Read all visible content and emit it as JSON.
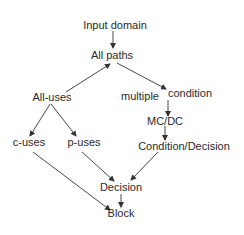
{
  "diagram": {
    "type": "hierarchy",
    "nodes": {
      "input_domain": "Input domain",
      "all_paths": "All paths",
      "all_uses": "All-uses",
      "multiple": "multiple",
      "condition": "condition",
      "mcdc": "MC/DC",
      "c_uses": "c-uses",
      "p_uses": "p-uses",
      "condition_decision": "Condition/Decision",
      "decision": "Decision",
      "block": "Block"
    },
    "edges": [
      {
        "from": "Input domain",
        "to": "All paths"
      },
      {
        "from": "All-uses",
        "to": "All paths"
      },
      {
        "from": "All paths",
        "to": "multiple condition"
      },
      {
        "from": "multiple condition",
        "to": "MC/DC"
      },
      {
        "from": "MC/DC",
        "to": "Condition/Decision"
      },
      {
        "from": "All-uses",
        "to": "c-uses"
      },
      {
        "from": "All-uses",
        "to": "p-uses"
      },
      {
        "from": "c-uses",
        "to": "Block"
      },
      {
        "from": "p-uses",
        "to": "Decision"
      },
      {
        "from": "Condition/Decision",
        "to": "Decision"
      },
      {
        "from": "Decision",
        "to": "Block"
      }
    ],
    "colors": {
      "text": "#2a2a2a",
      "edge": "#333333",
      "background": "#ffffff"
    }
  }
}
